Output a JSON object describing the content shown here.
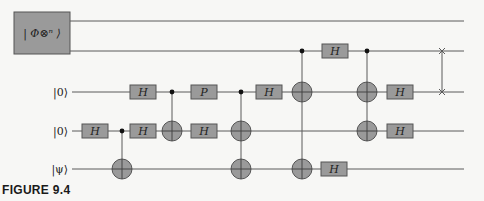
{
  "figure": {
    "caption": "FIGURE 9.4",
    "state_box_label": "| Φ⊗ⁿ ⟩"
  },
  "wires": [
    {
      "id": "w0",
      "label": "",
      "y": 21
    },
    {
      "id": "w1",
      "label": "",
      "y": 51
    },
    {
      "id": "w2",
      "label": "|0⟩",
      "y": 92
    },
    {
      "id": "w3",
      "label": "|0⟩",
      "y": 131
    },
    {
      "id": "w4",
      "label": "|ψ⟩",
      "y": 169
    }
  ],
  "gates": [
    {
      "type": "H",
      "label": "H",
      "x": 95,
      "wire": 3
    },
    {
      "type": "H",
      "label": "H",
      "x": 143,
      "wire": 2
    },
    {
      "type": "H",
      "label": "H",
      "x": 143,
      "wire": 3
    },
    {
      "type": "P",
      "label": "P",
      "x": 204,
      "wire": 2
    },
    {
      "type": "H",
      "label": "H",
      "x": 204,
      "wire": 3
    },
    {
      "type": "H",
      "label": "H",
      "x": 269,
      "wire": 2
    },
    {
      "type": "H",
      "label": "H",
      "x": 335,
      "wire": 1
    },
    {
      "type": "H",
      "label": "H",
      "x": 400,
      "wire": 2
    },
    {
      "type": "H",
      "label": "H",
      "x": 400,
      "wire": 3
    },
    {
      "type": "H",
      "label": "H",
      "x": 334,
      "wire": 4
    }
  ],
  "cnots": [
    {
      "x": 122,
      "control": 3,
      "targets": [
        4
      ]
    },
    {
      "x": 172,
      "control": 2,
      "targets": [
        3
      ]
    },
    {
      "x": 241,
      "control": 2,
      "targets": [
        3,
        4
      ]
    },
    {
      "x": 302,
      "control": 1,
      "targets": [
        2,
        4
      ]
    },
    {
      "x": 367,
      "control": 1,
      "targets": [
        2,
        3
      ]
    }
  ],
  "swap": {
    "x": 442,
    "wires": [
      1,
      2
    ]
  },
  "colors": {
    "gate_fill": "#9a9a9a",
    "wire": "#5a5a5a",
    "background": "#f7f7f5"
  }
}
